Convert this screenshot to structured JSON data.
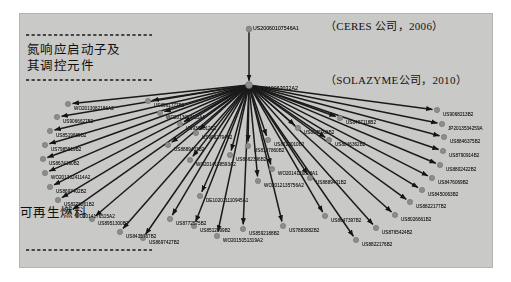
{
  "diagram": {
    "type": "citation-network",
    "background_color": "#c9c9c7",
    "node_color": "#8c8c8c",
    "edge_color": "#1a1a1a",
    "root_node": {
      "id": "US20060107546A1",
      "label": "US20060107546A1",
      "x": 249,
      "y": 29
    },
    "hub_node": {
      "id": "WO2010063032A2",
      "label": "WO2010063032A2",
      "x": 249,
      "y": 85
    },
    "annotations": [
      {
        "name": "ceres-annotation",
        "text": "（CERES 公司，2006）",
        "x": 325,
        "y": 22
      },
      {
        "name": "solazyme-annotation",
        "text": "（SOLAZYME公司，2010）",
        "x": 325,
        "y": 76
      }
    ],
    "zones": [
      {
        "name": "nitrogen-promoter-zone",
        "text": "氮响应启动子及\n其调控元件",
        "x": 27,
        "y": 42
      },
      {
        "name": "renewable-fuel-zone",
        "text": "可再生燃料",
        "x": 20,
        "y": 205
      }
    ],
    "dashed_lines": [
      {
        "name": "dashed-line-top",
        "x1": 26,
        "y1": 35,
        "x2": 152,
        "y2": 35
      },
      {
        "name": "dashed-line-middle",
        "x1": 26,
        "y1": 80,
        "x2": 152,
        "y2": 80
      },
      {
        "name": "dashed-line-bottom",
        "x1": 26,
        "y1": 250,
        "x2": 152,
        "y2": 250
      }
    ],
    "leaf_nodes": [
      {
        "label": "WO2013082186A2",
        "nx": 68,
        "ny": 104,
        "lx": 74,
        "ly": 106,
        "anchor": "start"
      },
      {
        "label": "US9066627B2",
        "nx": 57,
        "ny": 117,
        "lx": 63,
        "ly": 119,
        "anchor": "start"
      },
      {
        "label": "US8519689B2",
        "nx": 50,
        "ny": 131,
        "lx": 56,
        "ly": 133,
        "anchor": "start"
      },
      {
        "label": "US7985519B2",
        "nx": 45,
        "ny": 145,
        "lx": 51,
        "ly": 147,
        "anchor": "start"
      },
      {
        "label": "US8674190B2",
        "nx": 43,
        "ny": 159,
        "lx": 49,
        "ly": 161,
        "anchor": "start"
      },
      {
        "label": "WO2013024114A2",
        "nx": 45,
        "ny": 173,
        "lx": 51,
        "ly": 175,
        "anchor": "start"
      },
      {
        "label": "US8697402B2",
        "nx": 50,
        "ny": 187,
        "lx": 56,
        "ly": 189,
        "anchor": "start"
      },
      {
        "label": "US8278261B2",
        "nx": 58,
        "ny": 200,
        "lx": 64,
        "ly": 202,
        "anchor": "start"
      },
      {
        "label": "WO2014176515A2",
        "nx": 69,
        "ny": 212,
        "lx": 75,
        "ly": 214,
        "anchor": "start"
      },
      {
        "label": "US8951300B2",
        "nx": 92,
        "ny": 219,
        "lx": 98,
        "ly": 221,
        "anchor": "start"
      },
      {
        "label": "US8435767B2",
        "nx": 120,
        "ny": 232,
        "lx": 126,
        "ly": 234,
        "anchor": "start"
      },
      {
        "label": "US8697427B2",
        "nx": 143,
        "ny": 238,
        "lx": 149,
        "ly": 240,
        "anchor": "start"
      },
      {
        "label": "US8772575B2",
        "nx": 170,
        "ny": 219,
        "lx": 176,
        "ly": 221,
        "anchor": "start"
      },
      {
        "label": "US8512999B2",
        "nx": 194,
        "ny": 226,
        "lx": 200,
        "ly": 228,
        "anchor": "start"
      },
      {
        "label": "WO2015051319A2",
        "nx": 217,
        "ny": 236,
        "lx": 223,
        "ly": 238,
        "anchor": "start"
      },
      {
        "label": "US8592188B2",
        "nx": 243,
        "ny": 229,
        "lx": 249,
        "ly": 231,
        "anchor": "start"
      },
      {
        "label": "US7883882B2",
        "nx": 283,
        "ny": 226,
        "lx": 289,
        "ly": 228,
        "anchor": "start"
      },
      {
        "label": "US8647397B2",
        "nx": 325,
        "ny": 216,
        "lx": 331,
        "ly": 218,
        "anchor": "start"
      },
      {
        "label": "US8822176B2",
        "nx": 356,
        "ny": 240,
        "lx": 362,
        "ly": 242,
        "anchor": "start"
      },
      {
        "label": "US8765424B2",
        "nx": 376,
        "ny": 228,
        "lx": 382,
        "ly": 230,
        "anchor": "start"
      },
      {
        "label": "US8026661B2",
        "nx": 395,
        "ny": 215,
        "lx": 401,
        "ly": 217,
        "anchor": "start"
      },
      {
        "label": "US8822177B2",
        "nx": 410,
        "ny": 202,
        "lx": 416,
        "ly": 204,
        "anchor": "start"
      },
      {
        "label": "US8450063B2",
        "nx": 422,
        "ny": 190,
        "lx": 428,
        "ly": 192,
        "anchor": "start"
      },
      {
        "label": "US8476069B2",
        "nx": 432,
        "ny": 178,
        "lx": 438,
        "ly": 180,
        "anchor": "start"
      },
      {
        "label": "US8802422B2",
        "nx": 440,
        "ny": 165,
        "lx": 446,
        "ly": 167,
        "anchor": "start"
      },
      {
        "label": "US8790914B2",
        "nx": 443,
        "ny": 151,
        "lx": 449,
        "ly": 153,
        "anchor": "start"
      },
      {
        "label": "US8846375B2",
        "nx": 444,
        "ny": 137,
        "lx": 450,
        "ly": 139,
        "anchor": "start"
      },
      {
        "label": "JP2013534259A",
        "nx": 442,
        "ny": 124,
        "lx": 448,
        "ly": 126,
        "anchor": "start"
      },
      {
        "label": "US9068213B2",
        "nx": 437,
        "ny": 110,
        "lx": 443,
        "ly": 112,
        "anchor": "start"
      },
      {
        "label": "US8846362B2",
        "nx": 329,
        "ny": 140,
        "lx": 335,
        "ly": 142,
        "anchor": "start"
      },
      {
        "label": "US8497118B2",
        "nx": 340,
        "ny": 118,
        "lx": 346,
        "ly": 120,
        "anchor": "start"
      },
      {
        "label": "US8945908B2",
        "nx": 298,
        "ny": 128,
        "lx": 304,
        "ly": 130,
        "anchor": "start"
      },
      {
        "label": "US8222010B2",
        "nx": 268,
        "ny": 140,
        "lx": 274,
        "ly": 142,
        "anchor": "start"
      },
      {
        "label": "US8187860B2",
        "nx": 248,
        "ny": 146,
        "lx": 254,
        "ly": 148,
        "anchor": "start"
      },
      {
        "label": "US8662396B2",
        "nx": 230,
        "ny": 155,
        "lx": 236,
        "ly": 157,
        "anchor": "start"
      },
      {
        "label": "WO2014120828A1",
        "nx": 272,
        "ny": 169,
        "lx": 278,
        "ly": 171,
        "anchor": "start"
      },
      {
        "label": "WO2012135756A2",
        "nx": 258,
        "ny": 181,
        "lx": 264,
        "ly": 183,
        "anchor": "start"
      },
      {
        "label": "US8889401B2",
        "nx": 310,
        "ny": 178,
        "lx": 316,
        "ly": 180,
        "anchor": "start"
      },
      {
        "label": "WO2014138593A2",
        "nx": 190,
        "ny": 160,
        "lx": 196,
        "ly": 162,
        "anchor": "start"
      },
      {
        "label": "DE102011110945A1",
        "nx": 200,
        "ny": 196,
        "lx": 206,
        "ly": 198,
        "anchor": "start"
      },
      {
        "label": "US8889403B2",
        "nx": 168,
        "ny": 145,
        "lx": 174,
        "ly": 147,
        "anchor": "start"
      },
      {
        "label": "US9062794B2",
        "nx": 196,
        "ny": 133,
        "lx": 202,
        "ly": 135,
        "anchor": "start"
      },
      {
        "label": "US9303012B2",
        "nx": 180,
        "ny": 124,
        "lx": 186,
        "ly": 126,
        "anchor": "start"
      },
      {
        "label": "WO2013024111A1",
        "nx": 160,
        "ny": 113,
        "lx": 166,
        "ly": 115,
        "anchor": "start"
      },
      {
        "label": "US8961777B2",
        "nx": 148,
        "ny": 101,
        "lx": 154,
        "ly": 103,
        "anchor": "start"
      }
    ]
  }
}
